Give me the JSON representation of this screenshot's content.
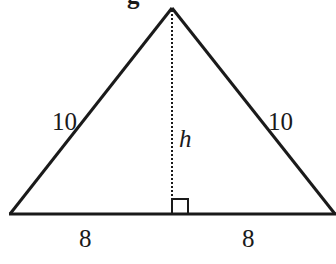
{
  "diagram": {
    "type": "isosceles-triangle",
    "header_fragment": "g",
    "sides": {
      "left": "10",
      "right": "10"
    },
    "height_label": "h",
    "base_segments": {
      "left": "8",
      "right": "8"
    },
    "right_angle_marker": true,
    "colors": {
      "stroke": "#1a1a1a",
      "background": "#ffffff"
    }
  }
}
